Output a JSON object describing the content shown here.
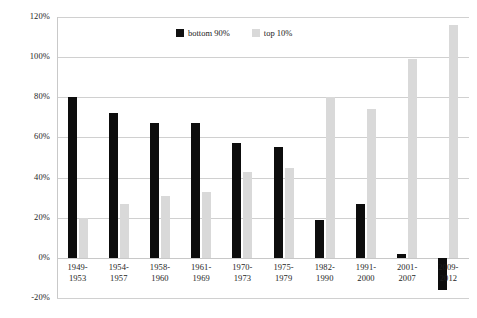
{
  "chart_data": {
    "type": "bar",
    "title": "",
    "subtitle": "",
    "xlabel": "",
    "ylabel": "",
    "ylim": [
      -20,
      120
    ],
    "ytick_values": [
      120,
      100,
      80,
      60,
      40,
      20,
      0,
      -20
    ],
    "ytick_labels": [
      "120%",
      "100%",
      "80%",
      "60%",
      "40%",
      "20%",
      "0%",
      "-20%"
    ],
    "grid": true,
    "legend_position": "top-center",
    "categories": [
      "1949-\n1953",
      "1954-\n1957",
      "1958-\n1960",
      "1961-\n1969",
      "1970-\n1973",
      "1975-\n1979",
      "1982-\n1990",
      "1991-\n2000",
      "2001-\n2007",
      "2009-\n2012"
    ],
    "series": [
      {
        "name": "bottom 90%",
        "color": "#0d0d0d",
        "values": [
          80,
          72,
          67,
          67,
          57,
          55,
          19,
          27,
          2,
          -16
        ]
      },
      {
        "name": "top 10%",
        "color": "#d9d9d9",
        "values": [
          20,
          27,
          31,
          33,
          43,
          45,
          80,
          74,
          99,
          116
        ]
      }
    ]
  },
  "legend": {
    "entries": [
      {
        "label": "bottom 90%",
        "swatch": "dark"
      },
      {
        "label": "top 10%",
        "swatch": "light"
      }
    ]
  },
  "colors": {
    "series_dark": "#0d0d0d",
    "series_light": "#d9d9d9",
    "gridline": "#d0d0d0",
    "text": "#1a1a1a",
    "background": "#ffffff"
  }
}
